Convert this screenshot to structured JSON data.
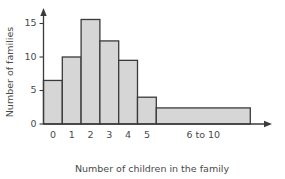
{
  "chart_data": {
    "type": "bar",
    "title": "",
    "subtitle": "",
    "xlabel": "Number of children in the family",
    "ylabel": "Number of families",
    "categories": [
      "0",
      "1",
      "2",
      "3",
      "4",
      "5",
      "6 to 10"
    ],
    "values": [
      6.5,
      10,
      15.6,
      12.4,
      9.5,
      4,
      2.4
    ],
    "bar_widths": [
      1,
      1,
      1,
      1,
      1,
      1,
      5
    ],
    "ylim": [
      0,
      17
    ],
    "yticks": [
      0,
      5,
      10,
      15
    ],
    "ytick_labels": [
      "0",
      "5",
      "10",
      "15"
    ],
    "xtick_labels": [
      "0",
      "1",
      "2",
      "3",
      "4",
      "5",
      "6 to 10"
    ],
    "grid": false,
    "legend": null,
    "annotations": [],
    "colors": {
      "bar_fill": "#d6d6d6",
      "bar_stroke": "#3a3a3a",
      "axis": "#3a3a3a",
      "text": "#4a4a4a",
      "background": "#ffffff"
    },
    "axis_arrows": {
      "x_axis_arrow": true,
      "y_axis_arrow": true
    }
  }
}
